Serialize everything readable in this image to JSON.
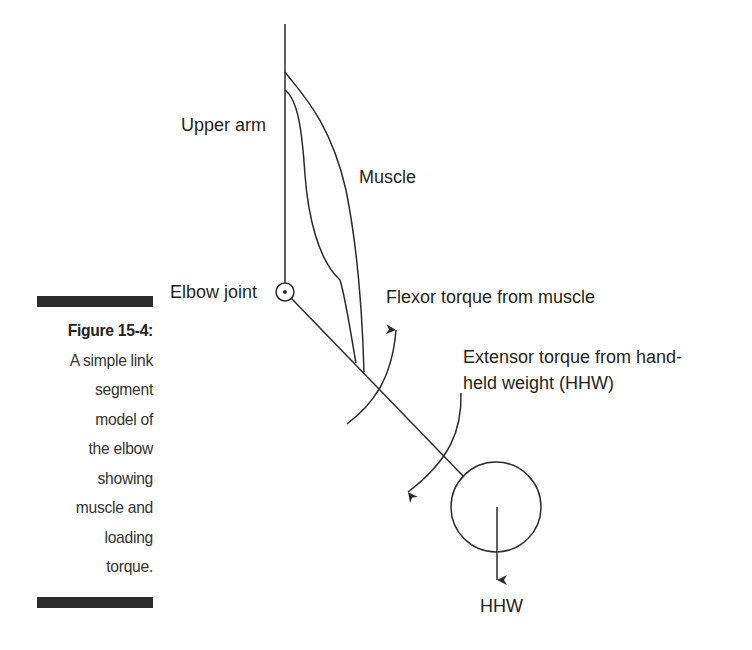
{
  "figure": {
    "number_label": "Figure 15-4:",
    "caption_lines": [
      "A simple link",
      "segment",
      "model of",
      "the elbow",
      "showing",
      "muscle and",
      "loading",
      "torque."
    ]
  },
  "diagram": {
    "labels": {
      "upper_arm": "Upper arm",
      "muscle": "Muscle",
      "elbow_joint": "Elbow joint",
      "flexor_torque": "Flexor torque from muscle",
      "extensor_torque_line1": "Extensor torque from hand-",
      "extensor_torque_line2": "held weight (HHW)",
      "hhw": "HHW"
    },
    "colors": {
      "stroke": "#2b2b2b",
      "text": "#231f20",
      "caption_bar": "#2b2b2b"
    }
  }
}
